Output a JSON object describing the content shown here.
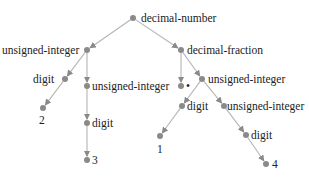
{
  "diagram": {
    "type": "parse-tree",
    "colors": {
      "node": "#8a8a8a",
      "edge": "#b5b5b5",
      "text": "#222222"
    },
    "nodes": [
      {
        "id": "n0",
        "label": "decimal-number",
        "x": 133,
        "y": 18,
        "lx": 141,
        "ly": 12,
        "anchor": "left"
      },
      {
        "id": "n1",
        "label": "unsigned-integer",
        "x": 87,
        "y": 50,
        "lx": 2,
        "ly": 44,
        "anchor": "left"
      },
      {
        "id": "n2",
        "label": "decimal-fraction",
        "x": 181,
        "y": 50,
        "lx": 187,
        "ly": 44,
        "anchor": "left"
      },
      {
        "id": "n3",
        "label": "digit",
        "x": 65,
        "y": 79,
        "lx": 33,
        "ly": 73,
        "anchor": "left"
      },
      {
        "id": "n4",
        "label": "unsigned-integer",
        "x": 87,
        "y": 86,
        "lx": 92,
        "ly": 80,
        "anchor": "left"
      },
      {
        "id": "n5",
        "label": "•",
        "x": 181,
        "y": 86,
        "lx": 186,
        "ly": 80,
        "anchor": "left"
      },
      {
        "id": "n6",
        "label": "unsigned-integer",
        "x": 202,
        "y": 79,
        "lx": 208,
        "ly": 73,
        "anchor": "left"
      },
      {
        "id": "n7",
        "label": "2",
        "x": 43,
        "y": 108,
        "lx": 39,
        "ly": 114,
        "anchor": "left"
      },
      {
        "id": "n8",
        "label": "digit",
        "x": 87,
        "y": 123,
        "lx": 92,
        "ly": 117,
        "anchor": "left"
      },
      {
        "id": "n9",
        "label": "digit",
        "x": 182,
        "y": 106,
        "lx": 187,
        "ly": 100,
        "anchor": "left"
      },
      {
        "id": "n10",
        "label": "unsigned-integer",
        "x": 224,
        "y": 106,
        "lx": 227,
        "ly": 100,
        "anchor": "left"
      },
      {
        "id": "n11",
        "label": "3",
        "x": 87,
        "y": 160,
        "lx": 92,
        "ly": 154,
        "anchor": "left"
      },
      {
        "id": "n12",
        "label": "1",
        "x": 160,
        "y": 136,
        "lx": 157,
        "ly": 143,
        "anchor": "left"
      },
      {
        "id": "n13",
        "label": "digit",
        "x": 246,
        "y": 135,
        "lx": 251,
        "ly": 129,
        "anchor": "left"
      },
      {
        "id": "n14",
        "label": "4",
        "x": 266,
        "y": 164,
        "lx": 272,
        "ly": 158,
        "anchor": "left"
      }
    ],
    "edges": [
      [
        "n0",
        "n1"
      ],
      [
        "n0",
        "n2"
      ],
      [
        "n1",
        "n3"
      ],
      [
        "n1",
        "n4"
      ],
      [
        "n2",
        "n5"
      ],
      [
        "n2",
        "n6"
      ],
      [
        "n3",
        "n7"
      ],
      [
        "n4",
        "n8"
      ],
      [
        "n6",
        "n9"
      ],
      [
        "n6",
        "n10"
      ],
      [
        "n8",
        "n11"
      ],
      [
        "n9",
        "n12"
      ],
      [
        "n10",
        "n13"
      ],
      [
        "n13",
        "n14"
      ]
    ]
  }
}
